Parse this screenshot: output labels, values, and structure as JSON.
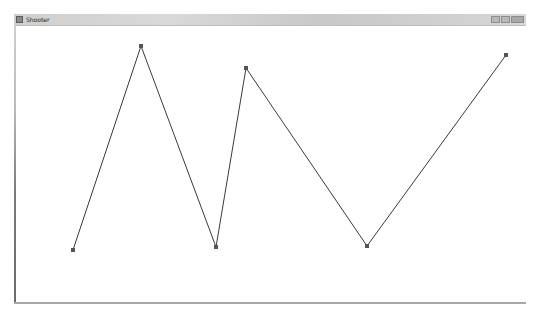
{
  "window": {
    "title": "Shooter",
    "icon": "app-icon",
    "controls": [
      "minimize",
      "maximize",
      "close"
    ]
  },
  "canvas": {
    "background": "#ffffff",
    "line_color": "#3a3a3a",
    "marker_color": "#555555",
    "polyline": [
      {
        "x": 73,
        "y": 250
      },
      {
        "x": 141,
        "y": 46
      },
      {
        "x": 216,
        "y": 247
      },
      {
        "x": 246,
        "y": 68
      },
      {
        "x": 367,
        "y": 246
      },
      {
        "x": 506,
        "y": 55
      }
    ]
  }
}
